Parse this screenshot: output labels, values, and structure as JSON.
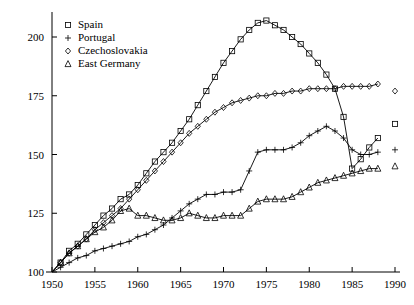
{
  "chart_data": {
    "type": "line",
    "title": "",
    "subtitle": "",
    "xlabel": "",
    "ylabel": "",
    "xlim": [
      1948,
      1991
    ],
    "ylim": [
      100,
      212
    ],
    "xticks": [
      1950,
      1955,
      1960,
      1965,
      1970,
      1975,
      1980,
      1985,
      1990
    ],
    "yticks": [
      100,
      125,
      150,
      175,
      200
    ],
    "grid": false,
    "legend_position": "top-left",
    "index_base": {
      "year": 1950,
      "value": 100
    },
    "series": [
      {
        "name": "Spain",
        "marker": "square",
        "x": [
          1950,
          1951,
          1952,
          1953,
          1954,
          1955,
          1956,
          1957,
          1958,
          1959,
          1960,
          1961,
          1962,
          1963,
          1964,
          1965,
          1966,
          1967,
          1968,
          1969,
          1970,
          1971,
          1972,
          1973,
          1974,
          1975,
          1976,
          1977,
          1978,
          1979,
          1980,
          1981,
          1982,
          1983,
          1984,
          1985,
          1986,
          1987,
          1988,
          1990
        ],
        "values": [
          100,
          104,
          109,
          112,
          116,
          120,
          124,
          127,
          131,
          133,
          137,
          142,
          147,
          151,
          155,
          160,
          165,
          171,
          177,
          183,
          189,
          194,
          199,
          203,
          206,
          207,
          205,
          203,
          200,
          197,
          193,
          189,
          184,
          178,
          166,
          144,
          148,
          153,
          157,
          163
        ]
      },
      {
        "name": "Portugal",
        "marker": "plus",
        "x": [
          1950,
          1951,
          1952,
          1953,
          1954,
          1955,
          1956,
          1957,
          1958,
          1959,
          1960,
          1961,
          1962,
          1963,
          1964,
          1965,
          1966,
          1967,
          1968,
          1969,
          1970,
          1971,
          1972,
          1973,
          1974,
          1975,
          1976,
          1977,
          1978,
          1979,
          1980,
          1981,
          1982,
          1983,
          1984,
          1985,
          1986,
          1987,
          1988,
          1990
        ],
        "values": [
          100,
          102,
          104,
          106,
          107,
          109,
          110,
          111,
          112,
          113,
          115,
          116,
          118,
          120,
          123,
          126,
          129,
          131,
          133,
          133,
          134,
          134,
          135,
          143,
          151,
          152,
          152,
          152,
          153,
          155,
          158,
          160,
          162,
          160,
          157,
          152,
          150,
          150,
          151,
          152
        ]
      },
      {
        "name": "Czechoslovakia",
        "marker": "diamond",
        "x": [
          1950,
          1951,
          1952,
          1953,
          1954,
          1955,
          1956,
          1957,
          1958,
          1959,
          1960,
          1961,
          1962,
          1963,
          1964,
          1965,
          1966,
          1967,
          1968,
          1969,
          1970,
          1971,
          1972,
          1973,
          1974,
          1975,
          1976,
          1977,
          1978,
          1979,
          1980,
          1981,
          1982,
          1983,
          1984,
          1985,
          1986,
          1987,
          1988,
          1990
        ],
        "values": [
          100,
          104,
          108,
          111,
          114,
          118,
          121,
          124,
          127,
          131,
          135,
          139,
          143,
          147,
          151,
          155,
          159,
          162,
          165,
          168,
          170,
          172,
          173,
          174,
          175,
          175,
          176,
          176,
          177,
          177,
          178,
          178,
          178,
          178,
          179,
          179,
          179,
          179,
          180,
          177
        ]
      },
      {
        "name": "East Germany",
        "marker": "triangle",
        "x": [
          1950,
          1951,
          1952,
          1953,
          1954,
          1955,
          1956,
          1957,
          1958,
          1959,
          1960,
          1961,
          1962,
          1963,
          1964,
          1965,
          1966,
          1967,
          1968,
          1969,
          1970,
          1971,
          1972,
          1973,
          1974,
          1975,
          1976,
          1977,
          1978,
          1979,
          1980,
          1981,
          1982,
          1983,
          1984,
          1985,
          1986,
          1987,
          1988,
          1990
        ],
        "values": [
          100,
          104,
          108,
          111,
          114,
          117,
          119,
          122,
          126,
          127,
          124,
          124,
          123,
          122,
          122,
          123,
          125,
          124,
          123,
          123,
          124,
          124,
          124,
          127,
          130,
          131,
          131,
          131,
          132,
          134,
          136,
          138,
          139,
          140,
          141,
          142,
          143,
          144,
          144,
          145
        ]
      }
    ],
    "legend": [
      {
        "label": "Spain",
        "marker": "square"
      },
      {
        "label": "Portugal",
        "marker": "plus"
      },
      {
        "label": "Czechoslovakia",
        "marker": "diamond"
      },
      {
        "label": "East Germany",
        "marker": "triangle"
      }
    ],
    "axis_color": "#000000",
    "line_color": "#000000"
  }
}
